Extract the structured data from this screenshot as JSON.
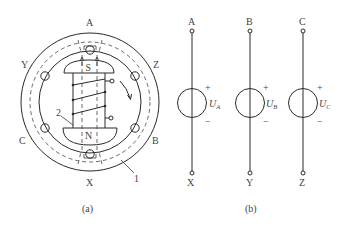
{
  "figure": {
    "panel_a": {
      "caption": "(a)",
      "phase_labels": {
        "A": "A",
        "B": "B",
        "C": "C",
        "X": "X",
        "Y": "Y",
        "Z": "Z"
      },
      "rotor": {
        "north_pole": "N",
        "south_pole": "S"
      },
      "callouts": {
        "stator": "1",
        "field_winding": "2"
      }
    },
    "panel_b": {
      "caption": "(b)",
      "sources": [
        {
          "top": "A",
          "bottom": "Y_placeholder",
          "symbol": "U",
          "subscript": "A",
          "plus": "+",
          "minus": "−"
        },
        {
          "top": "B",
          "symbol": "U",
          "subscript": "B",
          "plus": "+",
          "minus": "−"
        },
        {
          "top": "C",
          "symbol": "U",
          "subscript": "C",
          "plus": "+",
          "minus": "−"
        }
      ],
      "terminals_top": [
        "A",
        "B",
        "C"
      ],
      "terminals_bottom": [
        "X",
        "Y",
        "Z"
      ]
    },
    "colors": {
      "line": "#2a2a2a",
      "text": "#444444",
      "background": "#ffffff"
    }
  }
}
